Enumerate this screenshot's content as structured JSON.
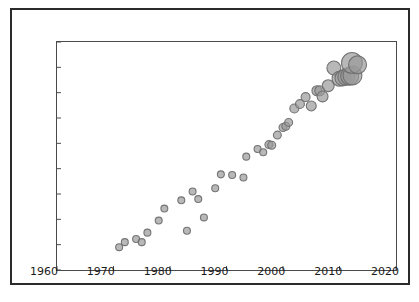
{
  "figure": {
    "background_color": "#ffffff",
    "frame_color": "#2b2b2b",
    "axes_color": "#4a4a4a"
  },
  "chart_data": {
    "type": "scatter",
    "title": "",
    "xlabel": "",
    "ylabel": "",
    "xlim": [
      1960,
      2020
    ],
    "ylim": [
      6,
      24
    ],
    "xticks": [
      1960,
      1970,
      1980,
      1990,
      2000,
      2010,
      2020
    ],
    "yticks": [
      6,
      8,
      10,
      12,
      14,
      16,
      18,
      20,
      22,
      24
    ],
    "xtick_labels": [
      "1960",
      "1970",
      "1980",
      "1990",
      "2000",
      "2010",
      "2020"
    ],
    "ytick_labels": [
      "6",
      "8",
      "10",
      "12",
      "14",
      "16",
      "18",
      "20",
      "22",
      "24"
    ],
    "grid": false,
    "legend": false,
    "marker_style": "open-circle-with-gray-fill",
    "marker_edge_color": "#6e6e6e",
    "marker_face_color": "#9a9a9a",
    "marker_opacity": 0.7,
    "size_encodes": "third-variable-magnitude",
    "points": [
      {
        "x": 1971,
        "y": 7.8,
        "size": 7
      },
      {
        "x": 1972,
        "y": 8.2,
        "size": 7
      },
      {
        "x": 1974,
        "y": 8.45,
        "size": 7
      },
      {
        "x": 1975,
        "y": 8.2,
        "size": 7
      },
      {
        "x": 1976,
        "y": 8.95,
        "size": 7
      },
      {
        "x": 1978,
        "y": 9.9,
        "size": 7
      },
      {
        "x": 1979,
        "y": 10.85,
        "size": 7
      },
      {
        "x": 1982,
        "y": 11.5,
        "size": 7
      },
      {
        "x": 1983,
        "y": 9.1,
        "size": 7
      },
      {
        "x": 1984,
        "y": 12.2,
        "size": 7
      },
      {
        "x": 1985,
        "y": 11.6,
        "size": 7
      },
      {
        "x": 1986,
        "y": 10.15,
        "size": 7
      },
      {
        "x": 1988,
        "y": 12.45,
        "size": 7
      },
      {
        "x": 1989,
        "y": 13.55,
        "size": 7
      },
      {
        "x": 1991,
        "y": 13.5,
        "size": 7
      },
      {
        "x": 1993,
        "y": 13.3,
        "size": 7
      },
      {
        "x": 1993.5,
        "y": 14.95,
        "size": 7
      },
      {
        "x": 1995.5,
        "y": 15.55,
        "size": 7
      },
      {
        "x": 1996.5,
        "y": 15.3,
        "size": 7
      },
      {
        "x": 1997.5,
        "y": 15.9,
        "size": 8
      },
      {
        "x": 1998,
        "y": 15.85,
        "size": 8
      },
      {
        "x": 1999,
        "y": 16.65,
        "size": 8
      },
      {
        "x": 2000,
        "y": 17.25,
        "size": 8
      },
      {
        "x": 2000.5,
        "y": 17.35,
        "size": 8
      },
      {
        "x": 2001,
        "y": 17.65,
        "size": 8
      },
      {
        "x": 2002,
        "y": 18.75,
        "size": 9
      },
      {
        "x": 2003,
        "y": 19.1,
        "size": 9
      },
      {
        "x": 2004,
        "y": 19.65,
        "size": 9
      },
      {
        "x": 2005,
        "y": 18.95,
        "size": 10
      },
      {
        "x": 2006,
        "y": 20.15,
        "size": 10
      },
      {
        "x": 2006.5,
        "y": 20.15,
        "size": 10
      },
      {
        "x": 2007,
        "y": 19.7,
        "size": 11
      },
      {
        "x": 2008,
        "y": 20.55,
        "size": 12
      },
      {
        "x": 2009,
        "y": 21.95,
        "size": 14
      },
      {
        "x": 2010,
        "y": 21.1,
        "size": 15
      },
      {
        "x": 2010.6,
        "y": 21.15,
        "size": 16
      },
      {
        "x": 2011.2,
        "y": 21.25,
        "size": 17
      },
      {
        "x": 2011.8,
        "y": 21.3,
        "size": 18
      },
      {
        "x": 2012.3,
        "y": 21.35,
        "size": 19
      },
      {
        "x": 2012.2,
        "y": 22.35,
        "size": 21
      },
      {
        "x": 2013.2,
        "y": 22.2,
        "size": 18
      }
    ]
  }
}
